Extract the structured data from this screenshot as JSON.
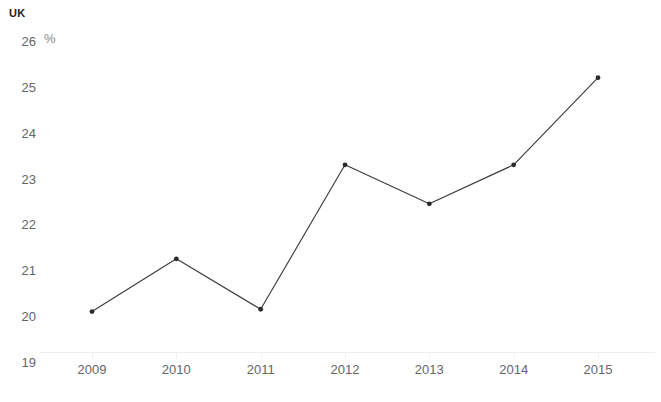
{
  "chart_data": {
    "type": "line",
    "title": "UK",
    "subtitle": "",
    "unit_label": "%",
    "xlabel": "",
    "ylabel": "",
    "categories": [
      "2009",
      "2010",
      "2011",
      "2012",
      "2013",
      "2014",
      "2015"
    ],
    "values": [
      20.1,
      21.25,
      20.15,
      23.3,
      22.45,
      23.3,
      25.2
    ],
    "series": [
      {
        "name": "UK",
        "values": [
          20.1,
          21.25,
          20.15,
          23.3,
          22.45,
          23.3,
          25.2
        ]
      }
    ],
    "ylim": [
      19,
      26
    ],
    "yticks": [
      19,
      20,
      21,
      22,
      23,
      24,
      25,
      26
    ],
    "ytick_labels": [
      "19",
      "20",
      "21",
      "22",
      "23",
      "24",
      "25",
      "26"
    ],
    "xtick_labels": [
      "2009",
      "2010",
      "2011",
      "2012",
      "2013",
      "2014",
      "2015"
    ],
    "grid": false,
    "legend": false,
    "legend_position": "none",
    "line_color": "#3c3c3c",
    "marker_color": "#2b2b2b",
    "axis_color": "#ededed",
    "tick_label_color": "#63666a",
    "title_color": "#222222",
    "unit_label_color": "#8a8a8a",
    "background_color": "#ffffff"
  }
}
